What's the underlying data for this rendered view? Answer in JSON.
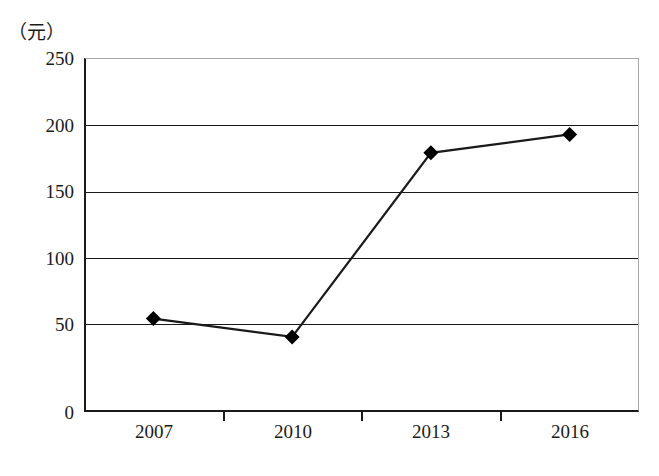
{
  "chart_data": {
    "type": "line",
    "title": "",
    "subtitle": "",
    "xlabel": "",
    "ylabel": "",
    "unit_label": "（元）",
    "categories": [
      "2007",
      "2010",
      "2013",
      "2016"
    ],
    "x": [
      "2007",
      "2010",
      "2013",
      "2016"
    ],
    "values": [
      66,
      53,
      183,
      196
    ],
    "series": [
      {
        "name": "",
        "values": [
          66,
          53,
          183,
          196
        ],
        "marker": "diamond",
        "marker_color": "#000000",
        "line_color": "#1a1a1a"
      }
    ],
    "ylim": [
      0,
      250
    ],
    "yticks": [
      0,
      50,
      100,
      150,
      200,
      250
    ],
    "ytick_labels": [
      "0",
      "50",
      "100",
      "150",
      "200",
      "250"
    ],
    "xtick_labels": [
      "2007",
      "2010",
      "2013",
      "2016"
    ],
    "grid": true,
    "grid_axis": "y",
    "legend": false,
    "legend_position": "none",
    "annotations": []
  },
  "axis": {
    "unit": "（元）",
    "y_ticks": [
      {
        "label": "250",
        "value": 250
      },
      {
        "label": "200",
        "value": 200
      },
      {
        "label": "150",
        "value": 150
      },
      {
        "label": "100",
        "value": 100
      },
      {
        "label": "50",
        "value": 50
      },
      {
        "label": "0",
        "value": 0
      }
    ],
    "x_ticks": [
      {
        "label": "2007"
      },
      {
        "label": "2010"
      },
      {
        "label": "2013"
      },
      {
        "label": "2016"
      }
    ]
  },
  "style": {
    "line_color": "#1a1a1a",
    "marker_color": "#000000",
    "grid_color": "#1a1a1a",
    "frame_color": "#a8a8a8",
    "axis_color": "#1a1a1a",
    "background": "#ffffff"
  }
}
